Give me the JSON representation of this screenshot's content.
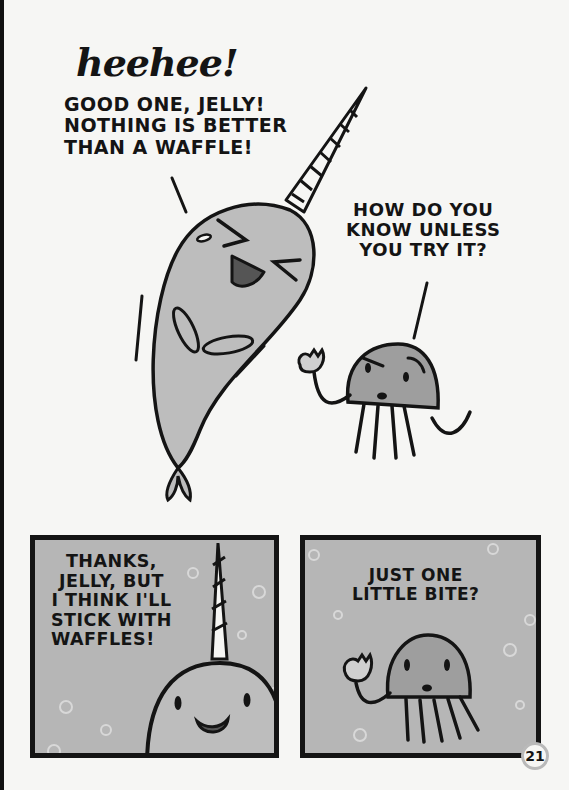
{
  "page": {
    "number": "21",
    "background": "#f6f6f4",
    "panel_fill": "#b6b6b6",
    "character_fill": "#bdbdbd",
    "ink": "#141414"
  },
  "top_panel": {
    "narwhal": {
      "sound_effect": "heehee!",
      "speech": [
        "GOOD ONE, JELLY!",
        "NOTHING IS BETTER",
        "THAN A WAFFLE!"
      ]
    },
    "jelly": {
      "speech": [
        "HOW DO YOU",
        "KNOW UNLESS",
        "YOU TRY IT?"
      ],
      "holding": "waffle-bite"
    }
  },
  "bottom_left_panel": {
    "speaker": "narwhal",
    "speech": [
      "THANKS,",
      "JELLY, BUT",
      "I THINK I'LL",
      "STICK WITH",
      "WAFFLES!"
    ]
  },
  "bottom_right_panel": {
    "speaker": "jelly",
    "speech": [
      "JUST ONE",
      "LITTLE BITE?"
    ]
  }
}
